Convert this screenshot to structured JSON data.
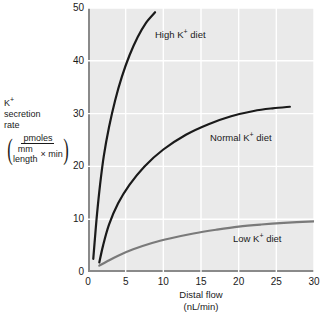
{
  "chart_data": {
    "type": "line",
    "title": "",
    "xlabel": "Distal flow",
    "xlabel_units": "(nL/min)",
    "ylabel_lines": [
      "K",
      "secretion",
      "rate"
    ],
    "ylabel_superscript": "+",
    "yunits": {
      "numerator": "pmoles",
      "denominator_top": "mm",
      "denominator_bottom": "length",
      "denominator_times": "× min"
    },
    "xlim": [
      0,
      30
    ],
    "ylim": [
      0,
      50
    ],
    "xticks": [
      0,
      5,
      10,
      15,
      20,
      25,
      30
    ],
    "yticks": [
      0,
      10,
      20,
      30,
      40,
      50
    ],
    "grid": true,
    "grid_color": "#ffffff",
    "plot_background": "#eaeaea",
    "axis_color": "#8a8a8a",
    "legend_position": "inline-annotations",
    "series": [
      {
        "name": "High K+ diet",
        "label_prefix": "High K",
        "label_suffix": " diet",
        "color": "#1a1a1a",
        "width": 2.2,
        "x": [
          0.7,
          0.9,
          1.2,
          1.6,
          2.1,
          2.8,
          3.6,
          4.5,
          5.5,
          6.6,
          7.7,
          8.9
        ],
        "y": [
          2.5,
          6.0,
          11.0,
          16.5,
          22.0,
          27.5,
          32.5,
          37.0,
          41.0,
          44.5,
          47.2,
          49.2
        ]
      },
      {
        "name": "Normal K+ diet",
        "label_prefix": "Normal K",
        "label_suffix": " diet",
        "color": "#1a1a1a",
        "width": 2.2,
        "x": [
          1.5,
          2.0,
          2.8,
          4.0,
          5.5,
          7.5,
          10.0,
          13.0,
          16.0,
          19.0,
          22.0,
          24.5,
          26.8
        ],
        "y": [
          1.8,
          5.0,
          9.0,
          13.0,
          16.5,
          20.0,
          23.2,
          26.0,
          28.0,
          29.5,
          30.5,
          31.0,
          31.3
        ]
      },
      {
        "name": "Low K+ diet",
        "label_prefix": "Low K",
        "label_suffix": " diet",
        "color": "#7a7a7a",
        "width": 2.2,
        "x": [
          1.5,
          2.5,
          4.0,
          6.0,
          8.5,
          11.0,
          14.0,
          17.0,
          20.0,
          23.0,
          26.0,
          30.0
        ],
        "y": [
          1.2,
          2.0,
          3.1,
          4.3,
          5.5,
          6.4,
          7.3,
          8.0,
          8.6,
          9.0,
          9.3,
          9.6
        ]
      }
    ],
    "annotations": [
      {
        "text": "High K+ diet",
        "x_px": 155,
        "y_px": 30
      },
      {
        "text": "Normal K+ diet",
        "x_px": 210,
        "y_px": 133
      },
      {
        "text": "Low K+ diet",
        "x_px": 233,
        "y_px": 234
      }
    ]
  }
}
